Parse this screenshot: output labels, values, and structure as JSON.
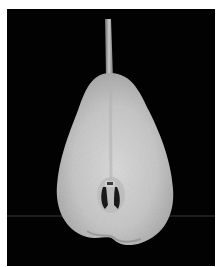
{
  "caption": {
    "text": "",
    "note_clipped": true
  },
  "photo": {
    "subject": "halved pear",
    "description": "Cross-section of a pear cut in half, pale grey flesh with visible stem and seed cavity, on a black background",
    "background_color": "#020202",
    "flesh_color": "#c9c9c9",
    "horizon_line_color": "#3a3a3a"
  }
}
